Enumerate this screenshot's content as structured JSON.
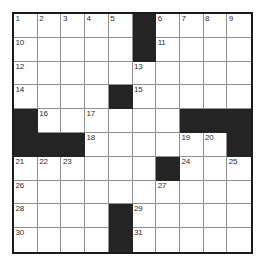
{
  "puzzle": {
    "type": "crossword-grid",
    "rows": 10,
    "cols": 10,
    "colors": {
      "block": "#242424",
      "cell": "#ffffff",
      "border": "#1a1a1a",
      "gridline": "#8f8f8f",
      "number": "#2b2b2b"
    },
    "grid": [
      [
        {
          "block": false,
          "number": "1"
        },
        {
          "block": false,
          "number": "2"
        },
        {
          "block": false,
          "number": "3"
        },
        {
          "block": false,
          "number": "4"
        },
        {
          "block": false,
          "number": "5"
        },
        {
          "block": true,
          "number": ""
        },
        {
          "block": false,
          "number": "6"
        },
        {
          "block": false,
          "number": "7"
        },
        {
          "block": false,
          "number": "8"
        },
        {
          "block": false,
          "number": "9"
        }
      ],
      [
        {
          "block": false,
          "number": "10"
        },
        {
          "block": false,
          "number": ""
        },
        {
          "block": false,
          "number": ""
        },
        {
          "block": false,
          "number": ""
        },
        {
          "block": false,
          "number": ""
        },
        {
          "block": true,
          "number": ""
        },
        {
          "block": false,
          "number": "11"
        },
        {
          "block": false,
          "number": ""
        },
        {
          "block": false,
          "number": ""
        },
        {
          "block": false,
          "number": ""
        }
      ],
      [
        {
          "block": false,
          "number": "12"
        },
        {
          "block": false,
          "number": ""
        },
        {
          "block": false,
          "number": ""
        },
        {
          "block": false,
          "number": ""
        },
        {
          "block": false,
          "number": ""
        },
        {
          "block": false,
          "number": "13"
        },
        {
          "block": false,
          "number": ""
        },
        {
          "block": false,
          "number": ""
        },
        {
          "block": false,
          "number": ""
        },
        {
          "block": false,
          "number": ""
        }
      ],
      [
        {
          "block": false,
          "number": "14"
        },
        {
          "block": false,
          "number": ""
        },
        {
          "block": false,
          "number": ""
        },
        {
          "block": false,
          "number": ""
        },
        {
          "block": true,
          "number": ""
        },
        {
          "block": false,
          "number": "15"
        },
        {
          "block": false,
          "number": ""
        },
        {
          "block": false,
          "number": ""
        },
        {
          "block": false,
          "number": ""
        },
        {
          "block": false,
          "number": ""
        }
      ],
      [
        {
          "block": true,
          "number": ""
        },
        {
          "block": false,
          "number": "16"
        },
        {
          "block": false,
          "number": ""
        },
        {
          "block": false,
          "number": "17"
        },
        {
          "block": false,
          "number": ""
        },
        {
          "block": false,
          "number": ""
        },
        {
          "block": false,
          "number": ""
        },
        {
          "block": true,
          "number": ""
        },
        {
          "block": true,
          "number": ""
        },
        {
          "block": true,
          "number": ""
        }
      ],
      [
        {
          "block": true,
          "number": ""
        },
        {
          "block": true,
          "number": ""
        },
        {
          "block": true,
          "number": ""
        },
        {
          "block": false,
          "number": "18"
        },
        {
          "block": false,
          "number": ""
        },
        {
          "block": false,
          "number": ""
        },
        {
          "block": false,
          "number": ""
        },
        {
          "block": false,
          "number": "19"
        },
        {
          "block": false,
          "number": "20"
        },
        {
          "block": true,
          "number": ""
        }
      ],
      [
        {
          "block": false,
          "number": "21"
        },
        {
          "block": false,
          "number": "22"
        },
        {
          "block": false,
          "number": "23"
        },
        {
          "block": false,
          "number": ""
        },
        {
          "block": false,
          "number": ""
        },
        {
          "block": false,
          "number": ""
        },
        {
          "block": true,
          "number": ""
        },
        {
          "block": false,
          "number": "24"
        },
        {
          "block": false,
          "number": ""
        },
        {
          "block": false,
          "number": "25"
        }
      ],
      [
        {
          "block": false,
          "number": "26"
        },
        {
          "block": false,
          "number": ""
        },
        {
          "block": false,
          "number": ""
        },
        {
          "block": false,
          "number": ""
        },
        {
          "block": false,
          "number": ""
        },
        {
          "block": false,
          "number": ""
        },
        {
          "block": false,
          "number": "27"
        },
        {
          "block": false,
          "number": ""
        },
        {
          "block": false,
          "number": ""
        },
        {
          "block": false,
          "number": ""
        }
      ],
      [
        {
          "block": false,
          "number": "28"
        },
        {
          "block": false,
          "number": ""
        },
        {
          "block": false,
          "number": ""
        },
        {
          "block": false,
          "number": ""
        },
        {
          "block": true,
          "number": ""
        },
        {
          "block": false,
          "number": "29"
        },
        {
          "block": false,
          "number": ""
        },
        {
          "block": false,
          "number": ""
        },
        {
          "block": false,
          "number": ""
        },
        {
          "block": false,
          "number": ""
        }
      ],
      [
        {
          "block": false,
          "number": "30"
        },
        {
          "block": false,
          "number": ""
        },
        {
          "block": false,
          "number": ""
        },
        {
          "block": false,
          "number": ""
        },
        {
          "block": true,
          "number": ""
        },
        {
          "block": false,
          "number": "31"
        },
        {
          "block": false,
          "number": ""
        },
        {
          "block": false,
          "number": ""
        },
        {
          "block": false,
          "number": ""
        },
        {
          "block": false,
          "number": ""
        }
      ]
    ]
  }
}
